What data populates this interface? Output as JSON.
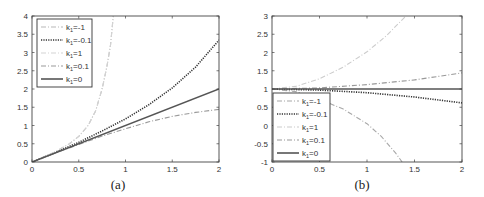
{
  "chart_data": [
    {
      "type": "line",
      "caption": "(a)",
      "title": "",
      "xlabel": "",
      "ylabel": "",
      "xlim": [
        0,
        2
      ],
      "ylim": [
        0,
        4
      ],
      "xticks": [
        "0",
        "0.5",
        "1",
        "1.5",
        "2"
      ],
      "yticks": [
        "0",
        "0.5",
        "1",
        "1.5",
        "2",
        "2.5",
        "3",
        "3.5",
        "4"
      ],
      "grid": false,
      "legend_position": "upper left",
      "series": [
        {
          "name": "k1=-1",
          "label_k": "k",
          "label_sub": "1",
          "label_rest": "=-1",
          "style": "dashdot",
          "color": "#b8b8b8",
          "x": [
            0,
            0.25,
            0.4,
            0.5,
            0.6,
            0.68,
            0.75,
            0.8,
            0.84,
            0.87
          ],
          "y": [
            0,
            0.28,
            0.5,
            0.7,
            1.0,
            1.4,
            2.0,
            2.6,
            3.2,
            4.0
          ]
        },
        {
          "name": "k1=-0.1",
          "label_k": "k",
          "label_sub": "1",
          "label_rest": "=-0.1",
          "style": "dotted",
          "color": "#333333",
          "x": [
            0,
            0.25,
            0.5,
            0.75,
            1,
            1.25,
            1.5,
            1.75,
            2
          ],
          "y": [
            0,
            0.26,
            0.54,
            0.85,
            1.18,
            1.57,
            2.03,
            2.6,
            3.34
          ]
        },
        {
          "name": "k1=1",
          "label_k": "k",
          "label_sub": "1",
          "label_rest": "=1",
          "style": "dashdot",
          "color": "#d4d4d4",
          "x": [
            0,
            0.25,
            0.4,
            0.5,
            0.6,
            0.68,
            0.75,
            0.8,
            0.84,
            0.87
          ],
          "y": [
            0,
            0.28,
            0.5,
            0.7,
            1.0,
            1.4,
            2.0,
            2.6,
            3.2,
            4.0
          ]
        },
        {
          "name": "k1=0.1",
          "label_k": "k",
          "label_sub": "1",
          "label_rest": "=0.1",
          "style": "dashdot",
          "color": "#999999",
          "x": [
            0,
            0.25,
            0.5,
            0.75,
            1,
            1.25,
            1.5,
            1.75,
            2
          ],
          "y": [
            0,
            0.25,
            0.48,
            0.71,
            0.91,
            1.1,
            1.25,
            1.36,
            1.44
          ]
        },
        {
          "name": "k1=0",
          "label_k": "k",
          "label_sub": "1",
          "label_rest": "=0",
          "style": "solid",
          "color": "#555555",
          "x": [
            0,
            2
          ],
          "y": [
            0,
            2
          ]
        }
      ]
    },
    {
      "type": "line",
      "caption": "(b)",
      "title": "",
      "xlabel": "",
      "ylabel": "",
      "xlim": [
        0,
        2
      ],
      "ylim": [
        -1,
        3
      ],
      "xticks": [
        "0",
        "0.5",
        "1",
        "1.5",
        "2"
      ],
      "yticks": [
        "-1",
        "-0.5",
        "0",
        "0.5",
        "1",
        "1.5",
        "2",
        "2.5",
        "3"
      ],
      "grid": false,
      "legend_position": "lower left",
      "series": [
        {
          "name": "k1=-1",
          "label_k": "k",
          "label_sub": "1",
          "label_rest": "=-1",
          "style": "dashdot",
          "color": "#a8a8a8",
          "x": [
            0,
            0.25,
            0.5,
            0.75,
            1,
            1.15,
            1.3,
            1.37
          ],
          "y": [
            1,
            0.93,
            0.72,
            0.45,
            0.05,
            -0.3,
            -0.75,
            -1
          ]
        },
        {
          "name": "k1=-0.1",
          "label_k": "k",
          "label_sub": "1",
          "label_rest": "=-0.1",
          "style": "dotted",
          "color": "#333333",
          "x": [
            0,
            0.5,
            1,
            1.5,
            2
          ],
          "y": [
            1,
            0.97,
            0.9,
            0.78,
            0.62
          ]
        },
        {
          "name": "k1=1",
          "label_k": "k",
          "label_sub": "1",
          "label_rest": "=1",
          "style": "dashdot",
          "color": "#cccccc",
          "x": [
            0,
            0.25,
            0.5,
            0.75,
            1,
            1.2,
            1.41
          ],
          "y": [
            1,
            1.07,
            1.28,
            1.6,
            2.02,
            2.45,
            3.0
          ]
        },
        {
          "name": "k1=0.1",
          "label_k": "k",
          "label_sub": "1",
          "label_rest": "=0.1",
          "style": "dashdot",
          "color": "#999999",
          "x": [
            0,
            0.5,
            1,
            1.5,
            2
          ],
          "y": [
            1,
            1.03,
            1.12,
            1.25,
            1.44
          ]
        },
        {
          "name": "k1=0",
          "label_k": "k",
          "label_sub": "1",
          "label_rest": "=0",
          "style": "solid",
          "color": "#555555",
          "x": [
            0,
            2
          ],
          "y": [
            1,
            1
          ]
        }
      ]
    }
  ]
}
